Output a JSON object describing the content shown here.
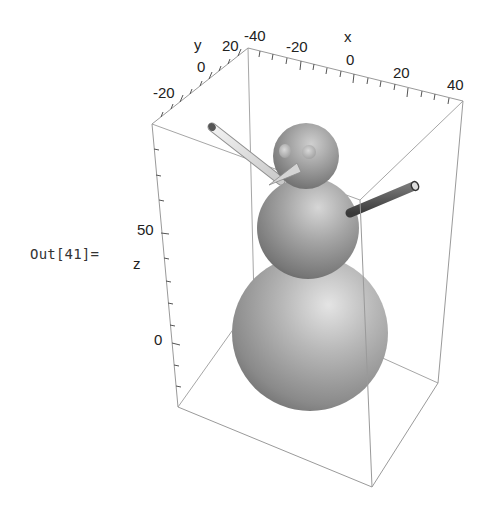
{
  "cell": {
    "output_label": "Out[41]="
  },
  "plot": {
    "type": "3d-graphics",
    "subject": "snowman",
    "axes": {
      "x": {
        "label": "x",
        "ticks": [
          "-40",
          "-20",
          "0",
          "20",
          "40"
        ]
      },
      "y": {
        "label": "y",
        "ticks": [
          "-20",
          "0",
          "20"
        ]
      },
      "z": {
        "label": "z",
        "ticks": [
          "0",
          "50"
        ]
      }
    },
    "colors": {
      "box_edge": "#9a9a9a",
      "axis": "#555555",
      "sphere_light": "#d8d8d8",
      "sphere_dark": "#5a5a5a",
      "left_arm": "#e0e0e0",
      "right_arm": "#555555",
      "nose": "#cfcfcf"
    },
    "objects": [
      {
        "name": "base-sphere"
      },
      {
        "name": "middle-sphere"
      },
      {
        "name": "head-sphere"
      },
      {
        "name": "left-eye"
      },
      {
        "name": "right-eye"
      },
      {
        "name": "nose-cone"
      },
      {
        "name": "left-arm-stick"
      },
      {
        "name": "right-arm-stick"
      }
    ]
  }
}
